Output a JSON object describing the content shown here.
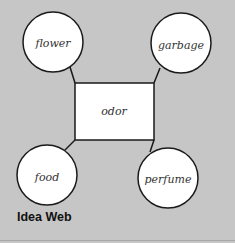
{
  "diagram": {
    "type": "idea-web",
    "center": {
      "label": "odor"
    },
    "nodes": [
      {
        "id": "flower",
        "label": "flower"
      },
      {
        "id": "garbage",
        "label": "garbage"
      },
      {
        "id": "food",
        "label": "food"
      },
      {
        "id": "perfume",
        "label": "perfume"
      }
    ],
    "edges": [
      {
        "from": "odor",
        "to": "flower"
      },
      {
        "from": "odor",
        "to": "garbage"
      },
      {
        "from": "odor",
        "to": "food"
      },
      {
        "from": "odor",
        "to": "perfume"
      }
    ],
    "caption": "Idea Web"
  },
  "colors": {
    "background": "#c6c6c6",
    "node_fill": "#ffffff",
    "stroke": "#1a1a1a"
  }
}
